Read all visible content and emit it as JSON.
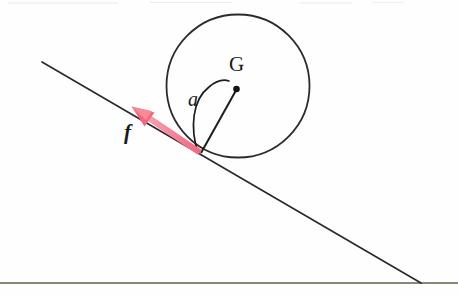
{
  "figure": {
    "kind": "physics-free-body-diagram",
    "background_color": "#fefefe"
  },
  "labels": {
    "center_of_gravity": "G",
    "angle": "a",
    "friction_force": "f"
  },
  "colors": {
    "stroke": "#2b2b28",
    "ground_stroke": "#5f6047",
    "force_vector": "#f4687e",
    "force_vector_light": "#f8a0ae",
    "point_marker": "#141414"
  },
  "geometry": {
    "canvas": {
      "width": 458,
      "height": 297
    },
    "circle": {
      "cx": 238,
      "cy": 86,
      "r": 71
    },
    "center_point": {
      "x": 236,
      "y": 89
    },
    "contact_point": {
      "x": 201,
      "y": 153
    },
    "incline_line": {
      "x1": 42,
      "y1": 62,
      "x2": 421,
      "y2": 283
    },
    "ground_line": {
      "x1": 0,
      "y1": 283,
      "x2": 458,
      "y2": 283
    },
    "force_vector": {
      "x1": 199,
      "y1": 152,
      "x2": 133,
      "y2": 108
    },
    "radius_line": {
      "x1": 201,
      "y1": 153,
      "x2": 236,
      "y2": 89
    },
    "angle_arc": {
      "start": {
        "x": 198,
        "y": 152
      },
      "end": {
        "x": 224,
        "y": 80
      },
      "label_position": {
        "x": 188,
        "y": 88
      }
    }
  }
}
